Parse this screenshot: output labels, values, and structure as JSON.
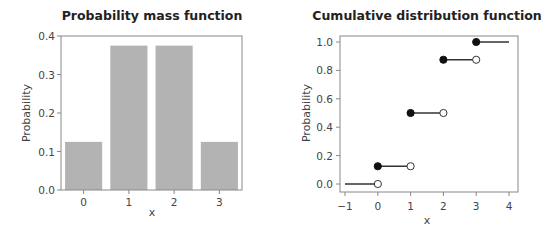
{
  "chart_data": [
    {
      "type": "bar",
      "title": "Probability mass function",
      "xlabel": "x",
      "ylabel": "Probability",
      "categories": [
        "0",
        "1",
        "2",
        "3"
      ],
      "values": [
        0.125,
        0.375,
        0.375,
        0.125
      ],
      "ylim": [
        0,
        0.4
      ],
      "yticks": [
        "0.0",
        "0.1",
        "0.2",
        "0.3",
        "0.4"
      ],
      "yticks_values": [
        0,
        0.1,
        0.2,
        0.3,
        0.4
      ],
      "grid": false,
      "bar_color": "#b3b3b3"
    },
    {
      "type": "line",
      "subtype": "step",
      "title": "Cumulative distribution function",
      "xlabel": "x",
      "ylabel": "Probability",
      "xlim": [
        -1,
        4
      ],
      "ylim": [
        0,
        1
      ],
      "xticks": [
        "−1",
        "0",
        "1",
        "2",
        "3",
        "4"
      ],
      "xticks_values": [
        -1,
        0,
        1,
        2,
        3,
        4
      ],
      "yticks": [
        "0.0",
        "0.2",
        "0.4",
        "0.6",
        "0.8",
        "1.0"
      ],
      "yticks_values": [
        0,
        0.2,
        0.4,
        0.6,
        0.8,
        1.0
      ],
      "grid": false,
      "segments": [
        {
          "x_start": -1,
          "x_end": 0,
          "y": 0.0,
          "closed_start": false,
          "open_end": true
        },
        {
          "x_start": 0,
          "x_end": 1,
          "y": 0.125,
          "closed_start": true,
          "open_end": true
        },
        {
          "x_start": 1,
          "x_end": 2,
          "y": 0.5,
          "closed_start": true,
          "open_end": true
        },
        {
          "x_start": 2,
          "x_end": 3,
          "y": 0.875,
          "closed_start": true,
          "open_end": true
        },
        {
          "x_start": 3,
          "x_end": 4,
          "y": 1.0,
          "closed_start": true,
          "open_end": false
        }
      ],
      "line_color": "#333333"
    }
  ]
}
